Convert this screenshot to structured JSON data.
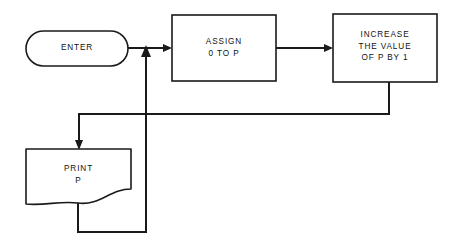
{
  "diagram": {
    "background_color": "#ffffff",
    "line_color": "#1a1a1a",
    "nodes": [
      {
        "id": "enter",
        "name": "terminal-enter",
        "shape": "stadium",
        "label": "ENTER",
        "x": 26,
        "y": 31,
        "w": 102,
        "h": 35
      },
      {
        "id": "assign",
        "name": "process-assign",
        "shape": "rectangle",
        "label": "ASSIGN\n0 TO P",
        "x": 172,
        "y": 15,
        "w": 104,
        "h": 66
      },
      {
        "id": "increase",
        "name": "process-increase",
        "shape": "rectangle",
        "label": "INCREASE\nTHE VALUE\nOF P BY 1",
        "x": 333,
        "y": 14,
        "w": 104,
        "h": 68
      },
      {
        "id": "print",
        "name": "document-print",
        "shape": "document",
        "label": "PRINT\nP",
        "x": 26,
        "y": 149,
        "w": 105,
        "h": 58
      }
    ],
    "edges": [
      {
        "id": "e1",
        "name": "edge-enter-to-assign",
        "from": "enter",
        "to": "assign",
        "arrow": true
      },
      {
        "id": "e2",
        "name": "edge-assign-to-increase",
        "from": "assign",
        "to": "increase",
        "arrow": true
      },
      {
        "id": "e3",
        "name": "edge-increase-to-print",
        "from": "increase",
        "to": "print",
        "arrow": true
      },
      {
        "id": "e4",
        "name": "edge-print-feedback-to-junction",
        "from": "print",
        "to": "enter",
        "arrow": true
      }
    ]
  }
}
